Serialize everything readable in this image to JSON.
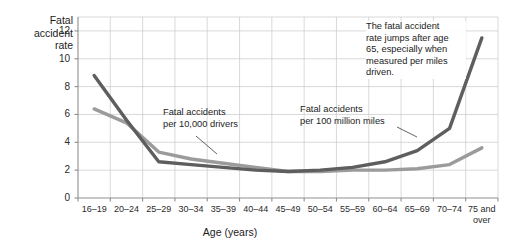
{
  "figure": {
    "y_axis_title": "Fatal\naccident\nrate",
    "x_axis_title": "Age (years)"
  },
  "annotations": {
    "series_label_drivers": "Fatal accidents\nper 10,000 drivers",
    "series_label_miles": "Fatal accidents\nper 100 million miles",
    "callout": "The fatal accident\nrate jumps after age\n65, especially when\nmeasured per miles\ndriven."
  },
  "colors": {
    "series_miles": "#5e5e5e",
    "series_drivers": "#9b9b9b",
    "grid": "#c9c9c9",
    "axis": "#8f8f8f",
    "text": "#1c1c1c"
  },
  "chart_data": {
    "type": "line",
    "title": "",
    "xlabel": "Age (years)",
    "ylabel": "Fatal accident rate",
    "categories": [
      "16–19",
      "20–24",
      "25–29",
      "30–34",
      "35–39",
      "40–44",
      "45–49",
      "50–54",
      "55–59",
      "60–64",
      "65–69",
      "70–74",
      "75 and\nover"
    ],
    "ylim": [
      0,
      13
    ],
    "yticks": [
      0,
      2,
      4,
      6,
      8,
      10,
      12
    ],
    "ytick_labels": [
      "0",
      "2",
      "4",
      "6",
      "8",
      "10",
      "12"
    ],
    "grid": true,
    "legend_position": "inline-annotations",
    "series": [
      {
        "name": "Fatal accidents per 100 million miles",
        "color": "#5e5e5e",
        "values": [
          8.8,
          5.6,
          2.6,
          2.4,
          2.2,
          2.0,
          1.9,
          2.0,
          2.2,
          2.6,
          3.4,
          5.0,
          11.5
        ]
      },
      {
        "name": "Fatal accidents per 10,000 drivers",
        "color": "#9b9b9b",
        "values": [
          6.4,
          5.4,
          3.3,
          2.8,
          2.5,
          2.2,
          1.9,
          1.9,
          2.0,
          2.0,
          2.1,
          2.4,
          3.6
        ]
      }
    ]
  }
}
